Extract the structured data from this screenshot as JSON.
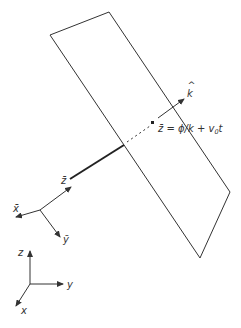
{
  "diagram": {
    "colors": {
      "line": "#333333",
      "background": "#ffffff"
    },
    "plane": {
      "corners": [
        [
          50,
          35
        ],
        [
          109,
          12
        ],
        [
          230,
          192
        ],
        [
          200,
          258
        ]
      ]
    },
    "wave_vector": {
      "label": "k",
      "hat": "^",
      "equation": "z̄ = ϕ/k + v",
      "equation_sub": "0",
      "equation_tail": "t"
    },
    "moving_frame": {
      "x_label": "x̄",
      "y_label": "ȳ",
      "z_label": "z̄"
    },
    "lab_frame": {
      "x_label": "x",
      "y_label": "y",
      "z_label": "z"
    }
  }
}
